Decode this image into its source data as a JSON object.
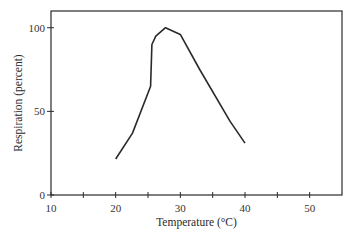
{
  "chart_data": {
    "type": "line",
    "title": "",
    "xlabel": "Temperature (°C)",
    "ylabel": "Respiration (percent)",
    "xlim": [
      10,
      55
    ],
    "ylim": [
      0,
      110
    ],
    "x_ticks": [
      10,
      15,
      20,
      25,
      30,
      35,
      40,
      45,
      50
    ],
    "x_tick_labels": [
      "10",
      "20",
      "30",
      "40",
      "50"
    ],
    "x_tick_label_values": [
      10,
      20,
      30,
      40,
      50
    ],
    "y_ticks": [
      0,
      50,
      100
    ],
    "y_tick_labels": [
      "0",
      "50",
      "100"
    ],
    "grid": false,
    "legend": null,
    "series": [
      {
        "name": "Respiration",
        "x": [
          20,
          22.6,
          25.4,
          25.6,
          26.2,
          27.7,
          30,
          33,
          37.7,
          40
        ],
        "y": [
          21.5,
          37,
          65,
          90,
          95,
          100,
          96,
          75,
          44,
          31
        ]
      }
    ],
    "line_color": "#2a2a2a"
  }
}
